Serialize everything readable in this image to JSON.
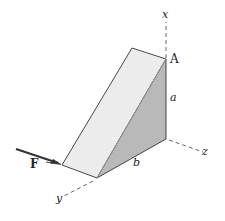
{
  "figure": {
    "labels": {
      "x_axis": "x",
      "y_axis": "y",
      "z_axis": "z",
      "point_A": "A",
      "dim_a": "a",
      "dim_b": "b",
      "force": "F"
    },
    "colors": {
      "front_face": "#ececec",
      "side_face": "#b9b9b9",
      "edges": "#333333",
      "axes": "#555555",
      "force_arrow": "#333333"
    }
  }
}
